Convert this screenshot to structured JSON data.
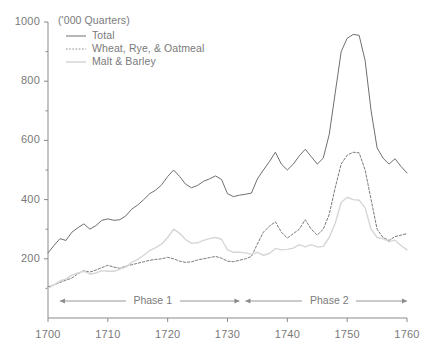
{
  "chart_data": {
    "type": "line",
    "title": "",
    "subtitle": "",
    "unit_label": "('000 Quarters)",
    "xlabel": "",
    "ylabel": "",
    "xlim": [
      1700,
      1760
    ],
    "ylim": [
      0,
      1000
    ],
    "grid": false,
    "legend_position": "top-left",
    "y_ticks": [
      "200",
      "400",
      "600",
      "800",
      "1000"
    ],
    "y_tick_values": [
      200,
      400,
      600,
      800,
      1000
    ],
    "y_minor_tick_values": [
      100,
      300,
      500,
      700,
      900
    ],
    "x_ticks": [
      "1700",
      "1710",
      "1720",
      "1730",
      "1740",
      "1750",
      "1760"
    ],
    "x_tick_values": [
      1700,
      1710,
      1720,
      1730,
      1740,
      1750,
      1760
    ],
    "x": [
      1700,
      1701,
      1702,
      1703,
      1704,
      1705,
      1706,
      1707,
      1708,
      1709,
      1710,
      1711,
      1712,
      1713,
      1714,
      1715,
      1716,
      1717,
      1718,
      1719,
      1720,
      1721,
      1722,
      1723,
      1724,
      1725,
      1726,
      1727,
      1728,
      1729,
      1730,
      1731,
      1732,
      1733,
      1734,
      1735,
      1736,
      1737,
      1738,
      1739,
      1740,
      1741,
      1742,
      1743,
      1744,
      1745,
      1746,
      1747,
      1748,
      1749,
      1750,
      1751,
      1752,
      1753,
      1754,
      1755,
      1756,
      1757,
      1758,
      1759,
      1760
    ],
    "series": [
      {
        "name": "Total",
        "style": "solid",
        "color": "#6f6f6f",
        "values": [
          220,
          245,
          268,
          262,
          290,
          305,
          318,
          300,
          312,
          330,
          335,
          330,
          332,
          345,
          368,
          382,
          400,
          420,
          432,
          450,
          478,
          500,
          478,
          452,
          440,
          448,
          462,
          470,
          480,
          468,
          420,
          410,
          415,
          418,
          422,
          470,
          500,
          528,
          560,
          520,
          500,
          520,
          548,
          570,
          545,
          520,
          540,
          620,
          760,
          900,
          945,
          958,
          955,
          870,
          700,
          575,
          540,
          520,
          538,
          512,
          490
        ]
      },
      {
        "name": "Wheat, Rye, & Oatmeal",
        "style": "dashed",
        "color": "#7a7a7a",
        "values": [
          105,
          112,
          120,
          128,
          135,
          150,
          160,
          155,
          162,
          170,
          178,
          172,
          168,
          175,
          180,
          185,
          190,
          195,
          198,
          200,
          205,
          200,
          192,
          188,
          190,
          196,
          200,
          204,
          208,
          202,
          192,
          190,
          195,
          200,
          208,
          250,
          290,
          310,
          325,
          290,
          270,
          285,
          300,
          332,
          300,
          280,
          300,
          350,
          440,
          520,
          550,
          560,
          558,
          500,
          400,
          300,
          272,
          262,
          275,
          280,
          285
        ]
      },
      {
        "name": "Malt & Barley",
        "style": "solid-light",
        "color": "#d6d6d6",
        "values": [
          100,
          112,
          125,
          132,
          145,
          152,
          158,
          148,
          152,
          160,
          158,
          158,
          165,
          172,
          188,
          198,
          212,
          228,
          238,
          250,
          272,
          300,
          286,
          265,
          252,
          254,
          262,
          268,
          272,
          266,
          230,
          222,
          222,
          220,
          215,
          222,
          212,
          218,
          235,
          230,
          232,
          236,
          248,
          240,
          248,
          240,
          242,
          272,
          320,
          390,
          408,
          400,
          398,
          372,
          300,
          272,
          268,
          258,
          263,
          245,
          230
        ]
      }
    ],
    "annotations": [
      {
        "label": "Phase 1",
        "from": 1702,
        "to": 1732,
        "arrow": "double"
      },
      {
        "label": "Phase 2",
        "from": 1733,
        "to": 1760,
        "arrow": "double"
      }
    ]
  },
  "axis": {
    "axis_color": "#8a8a8a"
  }
}
